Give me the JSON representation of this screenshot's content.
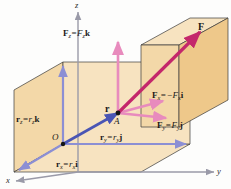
{
  "figure": {
    "axes": {
      "x_label": "x",
      "y_label": "y",
      "z_label": "z",
      "axis_color": "#9a9aa8"
    },
    "points": {
      "origin_label": "O",
      "application_point_label": "A"
    },
    "colors": {
      "box_face_light": "#f7e3c0",
      "box_face_mid": "#f3d8a8",
      "box_face_dark": "#eec88a",
      "position_vector": "#4a55b4",
      "position_component": "#8c8fd4",
      "force_resultant": "#c4276b",
      "force_component": "#e88bbd",
      "axis_gray": "#9a9aa8",
      "edge_line": "#3a3a3a",
      "text": "#1a1a1a"
    },
    "labels": {
      "force_resultant": {
        "text": "F",
        "vector_bold": true
      },
      "force_z": {
        "lhs_vec": "F",
        "lhs_sub": "z",
        "eq": "=",
        "rhs_scalar": "F",
        "rhs_sub": "z",
        "rhs_unit": "k",
        "sign": ""
      },
      "force_x": {
        "lhs_vec": "F",
        "lhs_sub": "x",
        "eq": "=",
        "rhs_scalar": "F",
        "rhs_sub": "x",
        "rhs_unit": "i",
        "sign": "−"
      },
      "force_y": {
        "lhs_vec": "F",
        "lhs_sub": "y",
        "eq": "=",
        "rhs_scalar": "F",
        "rhs_sub": "y",
        "rhs_unit": "j",
        "sign": ""
      },
      "position_resultant": {
        "text": "r",
        "vector_bold": true
      },
      "position_z": {
        "lhs_vec": "r",
        "lhs_sub": "z",
        "eq": "=",
        "rhs_scalar": "r",
        "rhs_sub": "z",
        "rhs_unit": "k",
        "sign": ""
      },
      "position_x": {
        "lhs_vec": "r",
        "lhs_sub": "x",
        "eq": "=",
        "rhs_scalar": "r",
        "rhs_sub": "x",
        "rhs_unit": "i",
        "sign": ""
      },
      "position_y": {
        "lhs_vec": "r",
        "lhs_sub": "y",
        "eq": "=",
        "rhs_scalar": "r",
        "rhs_sub": "y",
        "rhs_unit": "j",
        "sign": ""
      }
    }
  }
}
